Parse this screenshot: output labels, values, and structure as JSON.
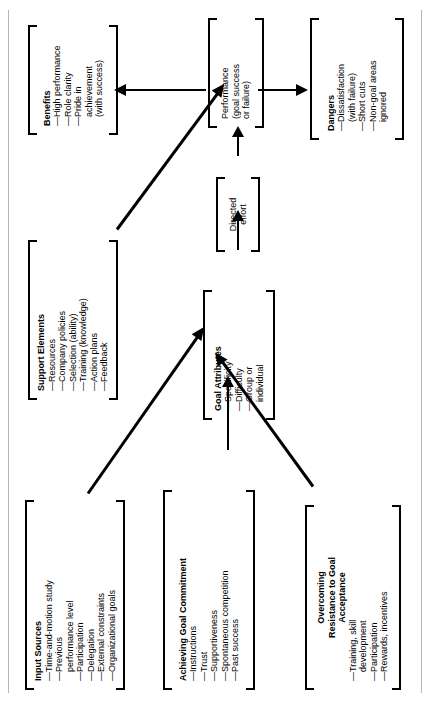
{
  "figure": {
    "type": "flow-diagram",
    "orientation": "rotated-90-counterclockwise",
    "ink_color": "#000000",
    "background": "#ffffff",
    "rule_color": "#b5b5b5"
  },
  "nodes": {
    "benefits": {
      "title": "Benefits",
      "items": [
        "High performance",
        "Role clarity",
        "Pride in achievement\n(with success)"
      ]
    },
    "support_elements": {
      "title": "Support Elements",
      "items": [
        "Resources",
        "Company policies",
        "Selection (ability)",
        "Training (knowledge)",
        "Action plans",
        "Feedback"
      ]
    },
    "input_sources": {
      "title": "Input Sources",
      "items": [
        "Time-and-motion study",
        "Previous\nperformance level",
        "Participation",
        "Delegation",
        "External constraints",
        "Organizational goals"
      ]
    },
    "achieving_goal_commitment": {
      "title": "Achieving Goal Commitment",
      "items": [
        "Instructions",
        "Trust",
        "Supportiveness",
        "Spontaneous competition",
        "Past success"
      ]
    },
    "overcoming_resistance": {
      "title": "Overcoming\nResistance to Goal\nAcceptance",
      "items": [
        "Training, skill\ndevelopment",
        "Participation",
        "Rewards, incentives"
      ]
    },
    "goal_attributes": {
      "title": "Goal Attributes",
      "items": [
        "Specificity",
        "Difficulty",
        "Group or\nindividual"
      ]
    },
    "directed_effort": {
      "title": "Directed\neffort",
      "items": []
    },
    "performance": {
      "title": "Performance\n(goal success\nor failure)",
      "items": []
    },
    "dangers": {
      "title": "Dangers",
      "items": [
        "Dissatisfaction\n(with failure)",
        "Short cuts",
        "Non-goal areas\nignored"
      ]
    }
  },
  "connections": [
    {
      "from": "input_sources",
      "to": "goal_attributes",
      "style": "arrow"
    },
    {
      "from": "achieving_goal_commitment",
      "to": "goal_attributes",
      "style": "arrow"
    },
    {
      "from": "overcoming_resistance",
      "to": "goal_attributes",
      "style": "arrow"
    },
    {
      "from": "goal_attributes",
      "to": "directed_effort",
      "style": "arrow"
    },
    {
      "from": "directed_effort",
      "to": "performance",
      "style": "arrow"
    },
    {
      "from": "support_elements",
      "to": "performance",
      "style": "arrow"
    },
    {
      "from": "performance",
      "to": "benefits",
      "style": "arrow"
    },
    {
      "from": "performance",
      "to": "dangers",
      "style": "arrow"
    }
  ]
}
